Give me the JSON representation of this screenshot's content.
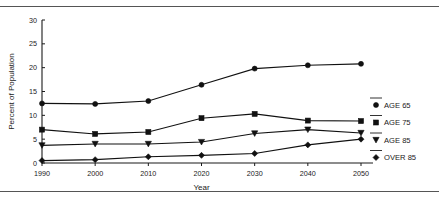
{
  "chart_data": {
    "type": "line",
    "title": "",
    "xlabel": "Year",
    "ylabel": "Percent of Population",
    "categories": [
      1990,
      2000,
      2010,
      2020,
      2030,
      2040,
      2050
    ],
    "x_tick_labels": [
      "1990",
      "2000",
      "2010",
      "2020",
      "2030",
      "2040",
      "2050"
    ],
    "y_tick_labels": [
      "0",
      "5",
      "10",
      "15",
      "20",
      "25",
      "30"
    ],
    "y_ticks": [
      0,
      5,
      10,
      15,
      20,
      25,
      30
    ],
    "xlim": [
      1990,
      2050
    ],
    "ylim": [
      0,
      30
    ],
    "grid": false,
    "legend_position": "right",
    "series": [
      {
        "name": "AGE 65",
        "marker": "circle",
        "values": [
          12.5,
          12.4,
          13.0,
          16.4,
          19.8,
          20.5,
          20.8
        ]
      },
      {
        "name": "AGE 75",
        "marker": "square",
        "values": [
          7.0,
          6.1,
          6.5,
          9.4,
          10.3,
          8.9,
          8.8
        ]
      },
      {
        "name": "AGE 85",
        "marker": "triangle",
        "values": [
          3.7,
          4.0,
          4.0,
          4.4,
          6.2,
          7.0,
          6.3
        ]
      },
      {
        "name": "OVER 85",
        "marker": "diamond",
        "values": [
          0.5,
          0.7,
          1.3,
          1.6,
          2.0,
          3.8,
          5.0
        ]
      }
    ],
    "colors": {
      "line": "#111111",
      "marker": "#111111",
      "axis": "#1a1a1a",
      "background": "#ffffff"
    }
  },
  "legend": {
    "entries": [
      {
        "label": "AGE 65"
      },
      {
        "label": "AGE 75"
      },
      {
        "label": "AGE 85"
      },
      {
        "label": "OVER 85"
      }
    ]
  }
}
